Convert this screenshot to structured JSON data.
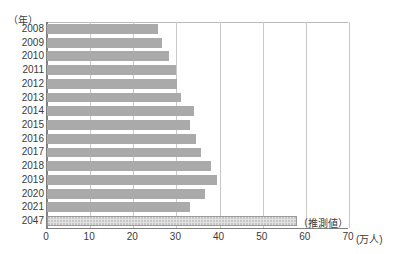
{
  "chart_data": {
    "type": "bar",
    "orientation": "horizontal",
    "title": "",
    "subtitle": "",
    "xlabel": "(万人)",
    "ylabel": "(年)",
    "xlim": [
      0,
      70
    ],
    "ylim_categories_order": "top-to-bottom",
    "grid": true,
    "grid_axis": "x",
    "legend": null,
    "legend_position": "none",
    "x_ticks": [
      0,
      10,
      20,
      30,
      40,
      50,
      60,
      70
    ],
    "x_tick_labels": [
      "0",
      "10",
      "20",
      "30",
      "40",
      "50",
      "60",
      "70"
    ],
    "categories": [
      "2008",
      "2009",
      "2010",
      "2011",
      "2012",
      "2013",
      "2014",
      "2015",
      "2016",
      "2017",
      "2018",
      "2019",
      "2020",
      "2021",
      "2047"
    ],
    "values": [
      25.7,
      26.6,
      28.2,
      29.8,
      30.2,
      31.1,
      34.1,
      33.2,
      34.5,
      35.7,
      38.0,
      39.4,
      36.6,
      33.2,
      58.0
    ],
    "series": [
      {
        "name": "実績",
        "values": [
          25.7,
          26.6,
          28.2,
          29.8,
          30.2,
          31.1,
          34.1,
          33.2,
          34.5,
          35.7,
          38.0,
          39.4,
          36.6,
          33.2,
          null
        ],
        "color": "#aaaaaa"
      },
      {
        "name": "推測値",
        "values": [
          null,
          null,
          null,
          null,
          null,
          null,
          null,
          null,
          null,
          null,
          null,
          null,
          null,
          null,
          58.0
        ],
        "color": "#e3e3e3"
      }
    ],
    "annotations": [
      {
        "text": "（推測値）",
        "x": 58.5,
        "category": "2047"
      }
    ]
  },
  "axis": {
    "y_unit_label": "（年）",
    "x_unit_label": "(万人)"
  }
}
